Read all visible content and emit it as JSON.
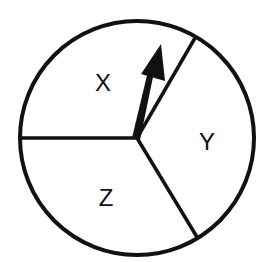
{
  "diagram": {
    "type": "spinner",
    "colors": {
      "stroke": "#111111",
      "fill": "#ffffff",
      "text": "#111111"
    },
    "sections": [
      {
        "label": "X",
        "position": "upper-left"
      },
      {
        "label": "Y",
        "position": "right"
      },
      {
        "label": "Z",
        "position": "lower-left"
      }
    ],
    "pointer": {
      "name": "arrow",
      "points_to": "X",
      "direction": "up, slightly right"
    }
  }
}
